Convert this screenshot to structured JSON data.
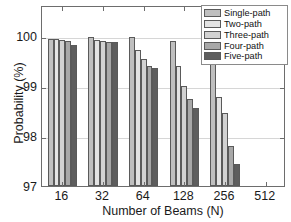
{
  "chart_data": {
    "type": "bar",
    "title": "",
    "xlabel": "Number of Beams (N)",
    "ylabel": "Probability (%)",
    "categories": [
      "16",
      "32",
      "64",
      "128",
      "256",
      "512"
    ],
    "xtick_labels": [
      "16",
      "32",
      "64",
      "128",
      "256",
      "512"
    ],
    "ytick_labels": [
      "97",
      "98",
      "99",
      "100"
    ],
    "ytick_values": [
      97,
      98,
      99,
      100
    ],
    "ylim": [
      97,
      100.62
    ],
    "xlim_categories": 6,
    "grid": true,
    "legend_position": "top-right",
    "series": [
      {
        "name": "Single-path",
        "color": "#bfbfbf",
        "values": [
          99.95,
          99.99,
          99.98,
          99.91,
          99.59,
          null
        ]
      },
      {
        "name": "Two-path",
        "color": "#e3e3e3",
        "values": [
          99.94,
          99.93,
          99.73,
          99.4,
          98.78,
          null
        ]
      },
      {
        "name": "Three-path",
        "color": "#d2d2d2",
        "values": [
          99.92,
          99.9,
          99.55,
          99.0,
          98.46,
          null
        ]
      },
      {
        "name": "Four-path",
        "color": "#a8a8a8",
        "values": [
          99.9,
          99.88,
          99.41,
          98.74,
          97.8,
          null
        ]
      },
      {
        "name": "Five-path",
        "color": "#5e5e5e",
        "values": [
          99.82,
          99.88,
          99.37,
          98.57,
          97.44,
          null
        ]
      }
    ]
  },
  "legend": {
    "items": [
      {
        "label": "Single-path"
      },
      {
        "label": "Two-path"
      },
      {
        "label": "Three-path"
      },
      {
        "label": "Four-path"
      },
      {
        "label": "Five-path"
      }
    ]
  },
  "colors": {
    "axis": "#6d6d6d",
    "grid": "#d6d6d6",
    "text": "#1a1a1a",
    "background": "#ffffff",
    "bar_edge": "#5a5a5a"
  }
}
